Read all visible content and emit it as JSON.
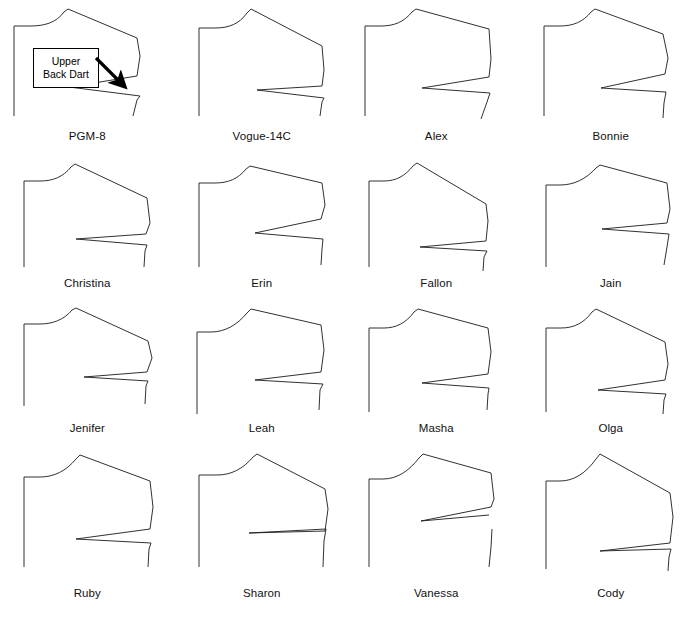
{
  "figure": {
    "background_color": "#ffffff",
    "line_color": "#1a1a1a",
    "text_color": "#111111",
    "columns": 4,
    "rows": 4
  },
  "annotation": {
    "label_line_1": "Upper",
    "label_line_2": "Back Dart",
    "target_pattern": "PGM-8",
    "box_border_color": "#000000",
    "arrow_color": "#000000"
  },
  "patterns": [
    {
      "label": "PGM-8",
      "row": 1,
      "column": 1,
      "outline": "M 10,22 L 10,112 M 10,22 L 26,22 C 40,22 52,19 60,8 L 64,5 L 133,34 L 136,52 L 133,72 L 65,83 L 136,92 L 133,96 L 129,112",
      "dart": {
        "opening": "wide",
        "tip_x": 65,
        "tip_y": 83
      }
    },
    {
      "label": "Vogue-14C",
      "row": 1,
      "column": 2,
      "outline": "M 10,24 L 10,112 M 10,24 L 26,24 C 40,24 50,20 58,9 L 62,5 L 133,42 L 135,66 L 133,82 L 68,86 L 135,94 L 133,98 L 131,112",
      "dart": {
        "opening": "narrow",
        "tip_x": 68,
        "tip_y": 86
      }
    },
    {
      "label": "Alex",
      "row": 1,
      "column": 3,
      "outline": "M 9,22 L 9,112 M 9,22 L 25,22 C 38,22 48,18 56,8 L 60,5 L 133,25 L 135,55 L 133,73 L 66,84 L 134,89 L 131,98 L 125,115",
      "dart": {
        "opening": "wide",
        "tip_x": 66,
        "tip_y": 84
      }
    },
    {
      "label": "Bonnie",
      "row": 1,
      "column": 4,
      "outline": "M 9,22 L 9,112 M 9,22 L 25,22 C 38,22 48,18 56,8 L 60,5 L 128,30 L 133,54 L 130,70 L 66,84 L 131,88 L 129,99 L 128,114",
      "dart": {
        "opening": "wide",
        "tip_x": 66,
        "tip_y": 84
      }
    },
    {
      "label": "Christina",
      "row": 2,
      "column": 1,
      "outline": "M 10,20 L 10,106 M 10,20 L 26,20 C 39,20 49,16 57,6 L 61,3 L 133,37 L 136,62 L 132,73 L 62,78 L 133,84 L 131,90 L 130,106",
      "dart": {
        "opening": "wide",
        "tip_x": 62,
        "tip_y": 78
      }
    },
    {
      "label": "Erin",
      "row": 2,
      "column": 2,
      "outline": "M 10,22 L 10,106 M 10,22 L 26,22 C 39,22 49,18 57,8 L 61,5 L 133,22 L 136,44 L 132,58 L 66,72 L 134,78 L 133,88 L 132,104",
      "dart": {
        "opening": "wide",
        "tip_x": 66,
        "tip_y": 72
      }
    },
    {
      "label": "Fallon",
      "row": 2,
      "column": 3,
      "outline": "M 9,20 L 9,106 M 9,20 L 24,20 C 36,20 45,15 53,5 L 57,2 L 126,43 L 128,60 L 126,80 L 60,86 L 127,90 L 124,96 L 123,110",
      "dart": {
        "opening": "wide",
        "tip_x": 60,
        "tip_y": 86
      }
    },
    {
      "label": "Jain",
      "row": 2,
      "column": 4,
      "outline": "M 10,24 L 10,106 M 10,24 L 24,24 C 38,24 50,18 60,7 L 64,4 L 131,22 L 134,48 L 131,62 L 66,68 L 133,73 L 131,86 L 128,104",
      "dart": {
        "opening": "wide",
        "tip_x": 66,
        "tip_y": 68
      }
    },
    {
      "label": "Jenifer",
      "row": 3,
      "column": 1,
      "outline": "M 10,18 L 10,100 M 10,18 L 26,18 C 38,18 50,14 58,4 L 62,2 L 134,35 L 138,52 L 133,66 L 70,71 L 134,75 L 132,80 L 131,98",
      "dart": {
        "opening": "wide",
        "tip_x": 70,
        "tip_y": 71
      }
    },
    {
      "label": "Leah",
      "row": 3,
      "column": 2,
      "outline": "M 10,26 L 10,108 M 10,26 L 24,26 C 38,26 50,19 60,7 L 64,3 L 134,19 L 137,44 L 134,66 L 68,74 L 136,78 L 133,84 L 132,104",
      "dart": {
        "opening": "wide",
        "tip_x": 68,
        "tip_y": 74
      }
    },
    {
      "label": "Masha",
      "row": 3,
      "column": 3,
      "outline": "M 9,22 L 9,106 M 9,22 L 24,22 C 36,22 46,17 54,6 L 58,3 L 128,22 L 131,46 L 128,68 L 62,77 L 129,82 L 128,88 L 127,104",
      "dart": {
        "opening": "wide",
        "tip_x": 62,
        "tip_y": 77
      }
    },
    {
      "label": "Olga",
      "row": 3,
      "column": 4,
      "outline": "M 10,22 L 10,106 M 10,22 L 25,22 C 38,22 48,17 56,6 L 60,3 L 129,36 L 132,58 L 129,74 L 62,84 L 130,88 L 128,94 L 127,108",
      "dart": {
        "opening": "wide",
        "tip_x": 62,
        "tip_y": 84
      }
    },
    {
      "label": "Ruby",
      "row": 4,
      "column": 1,
      "outline": "M 10,26 L 10,116 M 10,26 L 26,26 C 40,26 52,20 62,8 L 66,4 L 136,30 L 139,56 L 136,78 L 62,88 L 137,92 L 135,98 L 134,116",
      "dart": {
        "opening": "wide",
        "tip_x": 62,
        "tip_y": 88
      }
    },
    {
      "label": "Sharon",
      "row": 4,
      "column": 2,
      "outline": "M 10,24 L 10,116 M 10,24 L 28,24 C 42,24 54,18 64,6 L 68,3 L 136,38 L 139,58 L 136,78 L 60,82 L 137,80 L 135,90 L 134,116",
      "dart": {
        "opening": "pinched",
        "tip_x": 60,
        "tip_y": 82
      }
    },
    {
      "label": "Vanessa",
      "row": 4,
      "column": 3,
      "outline": "M 9,28 L 9,116 M 9,28 L 22,28 C 36,28 48,20 58,7 L 62,3 L 130,22 L 133,48 L 130,56 L 60,70 L 128,64 L 131,78 L 130,96 L 128,116",
      "dart": {
        "opening": "wide-split",
        "tip_x": 60,
        "tip_y": 70
      }
    },
    {
      "label": "Cody",
      "row": 4,
      "column": 4,
      "outline": "M 10,30 L 10,118 M 10,30 L 24,30 C 38,30 50,22 60,8 L 64,3 L 134,42 L 137,66 L 134,92 L 64,100 L 135,98 L 133,106 L 132,120",
      "dart": {
        "opening": "wide",
        "tip_x": 64,
        "tip_y": 100
      }
    }
  ]
}
